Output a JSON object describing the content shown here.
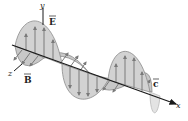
{
  "diagram": {
    "type": "electromagnetic-wave",
    "labels": {
      "y_axis": "y",
      "z_axis": "z",
      "x_axis": "x",
      "electric_field": "E",
      "magnetic_field": "B",
      "velocity": "c"
    },
    "colors": {
      "lobe_fill": "#c8c8c8",
      "lobe_stroke": "#8a8a8a",
      "arrow": "#7a7a7a",
      "axis": "#1a1a1a",
      "background": "#ffffff"
    }
  }
}
